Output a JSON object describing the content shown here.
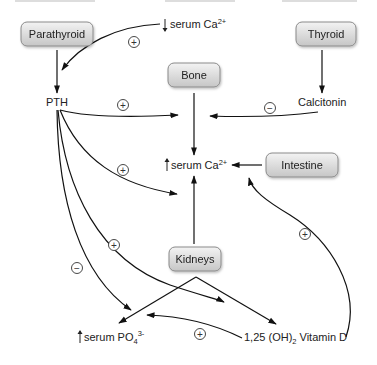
{
  "diagram": {
    "nodes": {
      "parathyroid": {
        "label": "Parathyroid",
        "type": "organ"
      },
      "thyroid": {
        "label": "Thyroid",
        "type": "organ"
      },
      "bone": {
        "label": "Bone",
        "type": "organ"
      },
      "intestine": {
        "label": "Intestine",
        "type": "organ"
      },
      "kidneys": {
        "label": "Kidneys",
        "type": "organ"
      },
      "serum_ca_low": {
        "arrow": "↓",
        "label": "serum Ca",
        "sup": "2+"
      },
      "pth": {
        "label": "PTH"
      },
      "calcitonin": {
        "label": "Calcitonin"
      },
      "serum_ca_high": {
        "arrow": "↑",
        "label": "serum Ca",
        "sup": "2+"
      },
      "serum_po4": {
        "arrow": "↑",
        "label": "serum PO",
        "sub": "4",
        "sup": "3-"
      },
      "vitamin_d": {
        "label_pre": "1,25 (OH)",
        "sub": "2",
        "label_post": " Vitamin D"
      }
    },
    "signs": {
      "plus": "+",
      "minus": "−"
    },
    "edges": [
      {
        "from": "↓ serum Ca2+",
        "to": "Parathyroid/PTH",
        "sign": "+"
      },
      {
        "from": "Parathyroid",
        "to": "PTH",
        "sign": ""
      },
      {
        "from": "Thyroid",
        "to": "Calcitonin",
        "sign": ""
      },
      {
        "from": "PTH",
        "to": "Bone→serum Ca2+",
        "sign": "+"
      },
      {
        "from": "Calcitonin",
        "to": "Bone→serum Ca2+",
        "sign": "−"
      },
      {
        "from": "Bone",
        "to": "↑ serum Ca2+",
        "sign": ""
      },
      {
        "from": "Intestine",
        "to": "↑ serum Ca2+",
        "sign": ""
      },
      {
        "from": "PTH",
        "to": "↑ serum Ca2+",
        "sign": "+"
      },
      {
        "from": "Kidneys",
        "to": "↑ serum Ca2+",
        "sign": ""
      },
      {
        "from": "PTH",
        "to": "Kidneys→Vitamin D",
        "sign": "+"
      },
      {
        "from": "PTH",
        "to": "↑ serum PO4 3-",
        "sign": "−"
      },
      {
        "from": "Kidneys",
        "to": "↑ serum PO4 3-",
        "sign": ""
      },
      {
        "from": "Kidneys",
        "to": "1,25 (OH)2 Vitamin D",
        "sign": ""
      },
      {
        "from": "1,25 (OH)2 Vitamin D",
        "to": "↑ serum PO4 3-",
        "sign": "+"
      },
      {
        "from": "1,25 (OH)2 Vitamin D",
        "to": "Intestine→serum Ca2+",
        "sign": "+"
      }
    ],
    "colors": {
      "box_fill_top": "#f2f2f2",
      "box_fill_bottom": "#c9c9c9",
      "box_stroke": "#8a8a8a",
      "line": "#111111",
      "text": "#222222"
    }
  }
}
